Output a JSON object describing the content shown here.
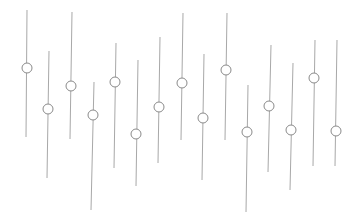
{
  "chart_data": {
    "type": "scatter",
    "subtype": "range-with-marker (vertical lines with circle markers)",
    "title": "",
    "xlabel": "",
    "ylabel": "",
    "grid": false,
    "legend": null,
    "coordinate_note": "values in screen pixels (y increases downward); no axes shown",
    "colors": {
      "line": "#a8a8a8",
      "marker_stroke": "#8a8a8a",
      "marker_fill": "#ffffff"
    },
    "marker_radius": 5,
    "series": [
      {
        "name": "ranges",
        "points": [
          {
            "x_top": 27,
            "y_top": 10,
            "x_bottom": 26,
            "y_bottom": 137,
            "marker_x": 27,
            "marker_y": 68
          },
          {
            "x_top": 49,
            "y_top": 51,
            "x_bottom": 47,
            "y_bottom": 178,
            "marker_x": 48,
            "marker_y": 109
          },
          {
            "x_top": 72,
            "y_top": 12,
            "x_bottom": 70,
            "y_bottom": 139,
            "marker_x": 71,
            "marker_y": 86
          },
          {
            "x_top": 94,
            "y_top": 82,
            "x_bottom": 91,
            "y_bottom": 210,
            "marker_x": 93,
            "marker_y": 115
          },
          {
            "x_top": 116,
            "y_top": 43,
            "x_bottom": 114,
            "y_bottom": 168,
            "marker_x": 115,
            "marker_y": 82
          },
          {
            "x_top": 138,
            "y_top": 60,
            "x_bottom": 136,
            "y_bottom": 186,
            "marker_x": 136,
            "marker_y": 134
          },
          {
            "x_top": 160,
            "y_top": 37,
            "x_bottom": 158,
            "y_bottom": 163,
            "marker_x": 159,
            "marker_y": 107
          },
          {
            "x_top": 183,
            "y_top": 13,
            "x_bottom": 181,
            "y_bottom": 140,
            "marker_x": 182,
            "marker_y": 83
          },
          {
            "x_top": 204,
            "y_top": 54,
            "x_bottom": 202,
            "y_bottom": 180,
            "marker_x": 203,
            "marker_y": 118
          },
          {
            "x_top": 227,
            "y_top": 13,
            "x_bottom": 225,
            "y_bottom": 140,
            "marker_x": 226,
            "marker_y": 70
          },
          {
            "x_top": 248,
            "y_top": 85,
            "x_bottom": 246,
            "y_bottom": 212,
            "marker_x": 247,
            "marker_y": 132
          },
          {
            "x_top": 271,
            "y_top": 45,
            "x_bottom": 268,
            "y_bottom": 172,
            "marker_x": 269,
            "marker_y": 106
          },
          {
            "x_top": 293,
            "y_top": 63,
            "x_bottom": 290,
            "y_bottom": 190,
            "marker_x": 291,
            "marker_y": 130
          },
          {
            "x_top": 315,
            "y_top": 40,
            "x_bottom": 313,
            "y_bottom": 166,
            "marker_x": 314,
            "marker_y": 78
          },
          {
            "x_top": 337,
            "y_top": 40,
            "x_bottom": 335,
            "y_bottom": 166,
            "marker_x": 336,
            "marker_y": 131
          }
        ]
      }
    ]
  }
}
